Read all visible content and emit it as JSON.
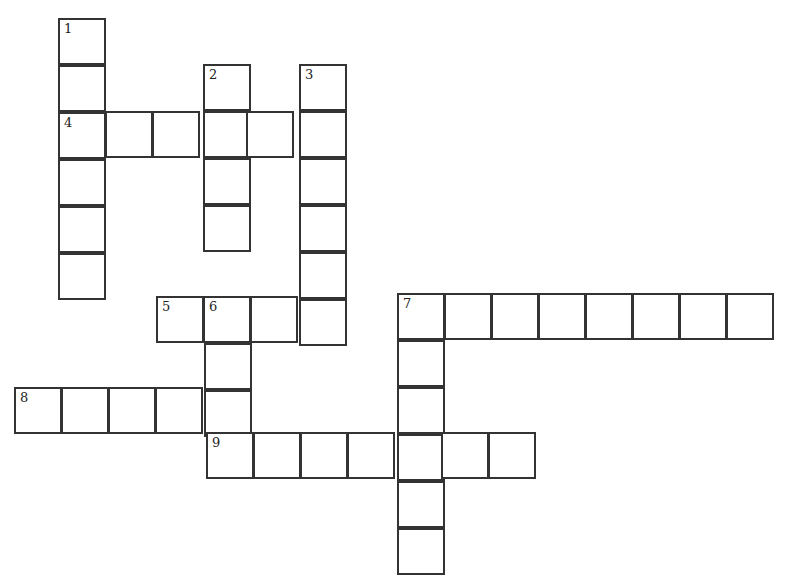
{
  "puzzle": {
    "type": "crossword",
    "cell_size": 47,
    "line_color": "#333333",
    "background": "#ffffff",
    "entries": [
      {
        "number": "1",
        "direction": "down",
        "x": 58,
        "y": 18,
        "length": 6
      },
      {
        "number": "2",
        "direction": "down",
        "x": 203,
        "y": 64,
        "length": 4
      },
      {
        "number": "3",
        "direction": "down",
        "x": 299,
        "y": 64,
        "length": 6
      },
      {
        "number": "4",
        "direction": "across",
        "x": 58,
        "y": 111,
        "length": 6
      },
      {
        "number": "5",
        "direction": "across",
        "x": 156,
        "y": 296,
        "length": 4
      },
      {
        "number": "6",
        "direction": "down",
        "x": 204,
        "y": 296,
        "length": 3
      },
      {
        "number": "7",
        "direction": "across",
        "x": 397,
        "y": 293,
        "length": 8
      },
      {
        "number": "7",
        "direction": "down",
        "x": 397,
        "y": 293,
        "length": 6
      },
      {
        "number": "8",
        "direction": "across",
        "x": 14,
        "y": 387,
        "length": 5
      },
      {
        "number": "9",
        "direction": "across",
        "x": 206,
        "y": 432,
        "length": 7
      }
    ]
  }
}
